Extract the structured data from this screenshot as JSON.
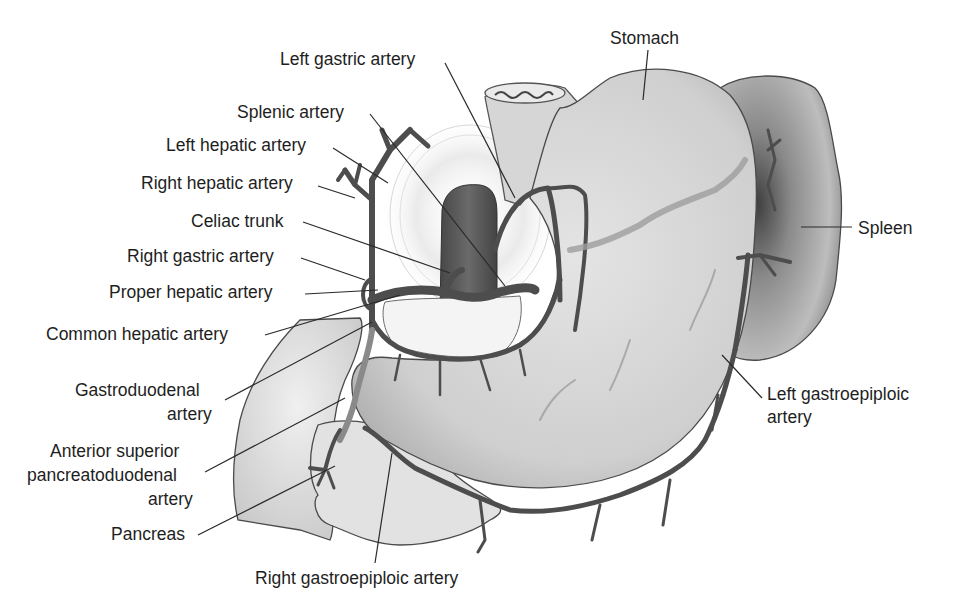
{
  "figure": {
    "colors": {
      "background": "#ffffff",
      "text": "#1e1e1e",
      "leader_line": "#2a2a2a",
      "stomach_fill": "#d4d4d4",
      "spleen_fill": "#9a9a9a",
      "pancreas_fill": "#e2e2e2",
      "liver_area_fill": "#e6e6e6",
      "aorta_fill": "#5a5a5a",
      "artery_stroke": "#4d4d4d"
    }
  },
  "labels": {
    "stomach": {
      "text": "Stomach",
      "x": 610,
      "y": 44
    },
    "spleen": {
      "text": "Spleen",
      "x": 858,
      "y": 234
    },
    "left_gastric_artery": {
      "text": "Left gastric artery",
      "x": 280,
      "y": 65
    },
    "splenic_artery": {
      "text": "Splenic artery",
      "x": 237,
      "y": 118
    },
    "left_hepatic_artery": {
      "text": "Left hepatic artery",
      "x": 166,
      "y": 151
    },
    "right_hepatic_artery": {
      "text": "Right hepatic artery",
      "x": 141,
      "y": 189
    },
    "celiac_trunk": {
      "text": "Celiac trunk",
      "x": 191,
      "y": 227
    },
    "right_gastric_artery": {
      "text": "Right gastric artery",
      "x": 127,
      "y": 262
    },
    "proper_hepatic_artery": {
      "text": "Proper hepatic artery",
      "x": 109,
      "y": 298
    },
    "common_hepatic_artery": {
      "text": "Common hepatic artery",
      "x": 46,
      "y": 340
    },
    "gastroduodenal_artery_line1": {
      "text": "Gastroduodenal",
      "x": 75,
      "y": 396
    },
    "gastroduodenal_artery_line2": {
      "text": "artery",
      "x": 167,
      "y": 420
    },
    "anterior_superior_pd_line1": {
      "text": "Anterior superior",
      "x": 50,
      "y": 457
    },
    "anterior_superior_pd_line2": {
      "text": "pancreatoduodenal",
      "x": 27,
      "y": 481
    },
    "anterior_superior_pd_line3": {
      "text": "artery",
      "x": 148,
      "y": 505
    },
    "pancreas": {
      "text": "Pancreas",
      "x": 111,
      "y": 540
    },
    "right_gastroepiploic_artery": {
      "text": "Right gastroepiploic artery",
      "x": 255,
      "y": 584
    },
    "left_gastroepiploic_artery_line1": {
      "text": "Left gastroepiploic",
      "x": 767,
      "y": 400
    },
    "left_gastroepiploic_artery_line2": {
      "text": "artery",
      "x": 767,
      "y": 423
    }
  }
}
